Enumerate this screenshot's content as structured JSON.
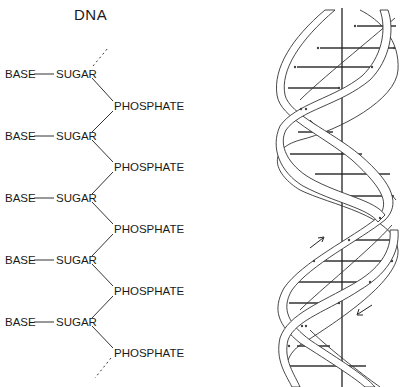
{
  "title": "DNA",
  "chain": {
    "units": [
      {
        "base": "BASE",
        "sugar": "SUGAR",
        "phosphate": "PHOSPHATE"
      },
      {
        "base": "BASE",
        "sugar": "SUGAR",
        "phosphate": "PHOSPHATE"
      },
      {
        "base": "BASE",
        "sugar": "SUGAR",
        "phosphate": "PHOSPHATE"
      },
      {
        "base": "BASE",
        "sugar": "SUGAR",
        "phosphate": "PHOSPHATE"
      },
      {
        "base": "BASE",
        "sugar": "SUGAR",
        "phosphate": "PHOSPHATE"
      }
    ],
    "continues_above": true,
    "continues_below": true
  },
  "helix": {
    "description": "Double helix with central axis, base-pair rungs and antiparallel strand arrows",
    "strands": 2,
    "arrows": [
      "up-right",
      "down-left"
    ],
    "colors": {
      "line": "#333333",
      "rung": "#777777",
      "background": "#ffffff"
    }
  }
}
